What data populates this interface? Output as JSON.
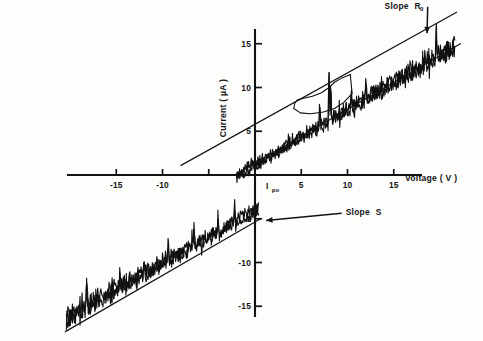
{
  "chart_data": {
    "type": "line",
    "title": "",
    "subtitle": "",
    "xlabel": "Voltage ( V )",
    "ylabel": "Current ( µA )",
    "xlim": [
      -20.5,
      21.5
    ],
    "ylim": [
      -18.0,
      18.5
    ],
    "grid": false,
    "legend_position": "none",
    "x_ticks": [
      -15,
      -10,
      -5,
      5,
      10,
      15
    ],
    "x_tick_labels": [
      "-15",
      "-10",
      "",
      "5",
      "10",
      "15"
    ],
    "y_ticks": [
      -15,
      -10,
      -5,
      5,
      10,
      15
    ],
    "y_tick_labels": [
      "-15",
      "-10",
      "-5",
      "5",
      "10",
      "15"
    ],
    "annotations": [
      {
        "name": "slope-r0",
        "text": "Slope",
        "symbol": "R",
        "subscript": "0",
        "x": 14.0,
        "y": 19.0,
        "arrow_to_x": 18.6,
        "arrow_to_y": 16.2
      },
      {
        "name": "slope-s",
        "text": "Slope",
        "symbol": "S",
        "subscript": "",
        "x": 9.8,
        "y": -4.6,
        "arrow_to_x": 1.2,
        "arrow_to_y": -5.2
      },
      {
        "name": "ipo",
        "text": "",
        "symbol": "I",
        "subscript": "po",
        "x": 1.2,
        "y": -1.6,
        "arrow_to_x": 0.0,
        "arrow_to_y": -4.6
      }
    ],
    "series": [
      {
        "name": "fit-line-slope-r0",
        "kind": "straight-fit",
        "style": "solid",
        "points": [
          [
            -8.0,
            1.1
          ],
          [
            21.8,
            18.6
          ]
        ]
      },
      {
        "name": "fit-line-slope-s-upper",
        "kind": "straight-fit",
        "style": "solid",
        "points": [
          [
            -2.2,
            0.0
          ],
          [
            22.2,
            15.0
          ]
        ]
      },
      {
        "name": "fit-line-slope-s-lower",
        "kind": "straight-fit",
        "style": "solid",
        "points": [
          [
            -20.5,
            -17.9
          ],
          [
            0.6,
            -5.0
          ]
        ]
      },
      {
        "name": "trace-positive-branch",
        "kind": "noisy-measurement",
        "style": "solid",
        "description": "forward-bias noisy I-V sweep with switching spikes near 7-9 V",
        "x_start": -2.0,
        "x_end": 21.6,
        "baseline_slope": 0.63,
        "baseline_intercept": 1.35,
        "noise_amplitude": 0.95,
        "spikes": [
          {
            "x": 7.0,
            "height": 3.2
          },
          {
            "x": 8.0,
            "height": 6.6
          },
          {
            "x": 8.2,
            "height": 4.0
          },
          {
            "x": 10.4,
            "height": 2.2
          },
          {
            "x": 12.0,
            "height": 1.8
          },
          {
            "x": 19.6,
            "height": 3.4
          }
        ],
        "hysteresis_loop": [
          [
            4.6,
            8.6
          ],
          [
            6.2,
            9.0
          ],
          [
            7.2,
            9.4
          ],
          [
            8.0,
            10.0
          ],
          [
            8.6,
            10.6
          ],
          [
            9.4,
            11.1
          ],
          [
            10.3,
            11.5
          ],
          [
            10.5,
            9.3
          ],
          [
            9.6,
            8.3
          ],
          [
            8.6,
            7.6
          ],
          [
            7.4,
            7.2
          ],
          [
            6.0,
            7.0
          ],
          [
            4.9,
            7.1
          ],
          [
            4.2,
            7.6
          ],
          [
            4.3,
            8.2
          ],
          [
            4.6,
            8.6
          ]
        ]
      },
      {
        "name": "trace-negative-branch",
        "kind": "noisy-measurement",
        "style": "solid",
        "description": "reverse-bias noisy I-V sweep, third quadrant",
        "x_start": -20.4,
        "x_end": 0.4,
        "baseline_slope": 0.6,
        "baseline_intercept": -3.9,
        "noise_amplitude": 1.05,
        "spikes": [
          {
            "x": -18.2,
            "height": 2.6
          },
          {
            "x": -14.6,
            "height": 2.2
          },
          {
            "x": -12.0,
            "height": 2.0
          },
          {
            "x": -9.4,
            "height": 2.4
          },
          {
            "x": -6.6,
            "height": 2.6
          },
          {
            "x": -4.0,
            "height": 2.2
          },
          {
            "x": -2.2,
            "height": 2.0
          }
        ],
        "hysteresis_loop": []
      }
    ]
  },
  "figure": {
    "caption": "",
    "background_color": "#fdfdfc",
    "ink_color": "#121212"
  }
}
